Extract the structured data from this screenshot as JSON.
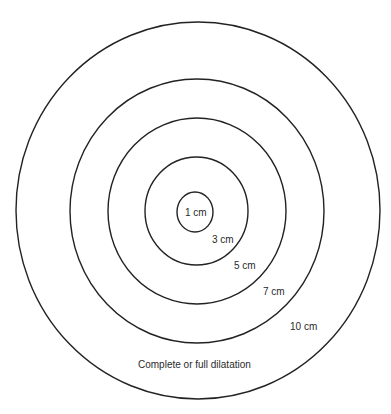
{
  "diagram": {
    "stroke_color": "#222222",
    "background": "#ffffff",
    "circles": [
      {
        "id": "1cm",
        "label": "1 cm",
        "cx": 195,
        "cy": 212,
        "rx": 18,
        "ry": 20
      },
      {
        "id": "3cm",
        "label": "3 cm",
        "cx": 196.5,
        "cy": 211,
        "rx": 51.5,
        "ry": 54
      },
      {
        "id": "5cm",
        "label": "5 cm",
        "cx": 197,
        "cy": 211,
        "rx": 89,
        "ry": 93
      },
      {
        "id": "7cm",
        "label": "7 cm",
        "cx": 197,
        "cy": 211,
        "rx": 127,
        "ry": 132
      },
      {
        "id": "10cm",
        "label": "10 cm",
        "cx": 198,
        "cy": 210.5,
        "rx": 182,
        "ry": 188.5
      }
    ],
    "labels": {
      "l1": "1 cm",
      "l3": "3 cm",
      "l5": "5 cm",
      "l7": "7 cm",
      "l10": "10 cm",
      "caption": "Complete or full dilatation"
    }
  }
}
